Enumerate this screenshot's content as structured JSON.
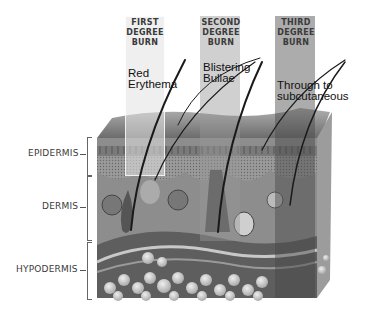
{
  "burns": [
    {
      "title_lines": [
        "FIRST",
        "DEGREE",
        "BURN"
      ],
      "description_lines": [
        "Red",
        "Erythema"
      ]
    },
    {
      "title_lines": [
        "SECOND",
        "DEGREE",
        "BURN"
      ],
      "description_lines": [
        "Blistering",
        "Bullae"
      ]
    },
    {
      "title_lines": [
        "THIRD",
        "DEGREE",
        "BURN"
      ],
      "description_lines": [
        "Through to",
        "subcutaneous"
      ]
    }
  ],
  "layers": [
    {
      "label": "EPIDERMIS"
    },
    {
      "label": "DERMIS"
    },
    {
      "label": "HYPODERMIS"
    }
  ],
  "colors": {
    "band_first": "#d4d4d4",
    "band_second": "#a8a8a8",
    "band_third": "#8a8a8a",
    "skin_top": "#8c8c8c",
    "dermis": "#8f8f8f",
    "hypodermis": "#6e6e6e",
    "fat": "#cfcfcf"
  }
}
